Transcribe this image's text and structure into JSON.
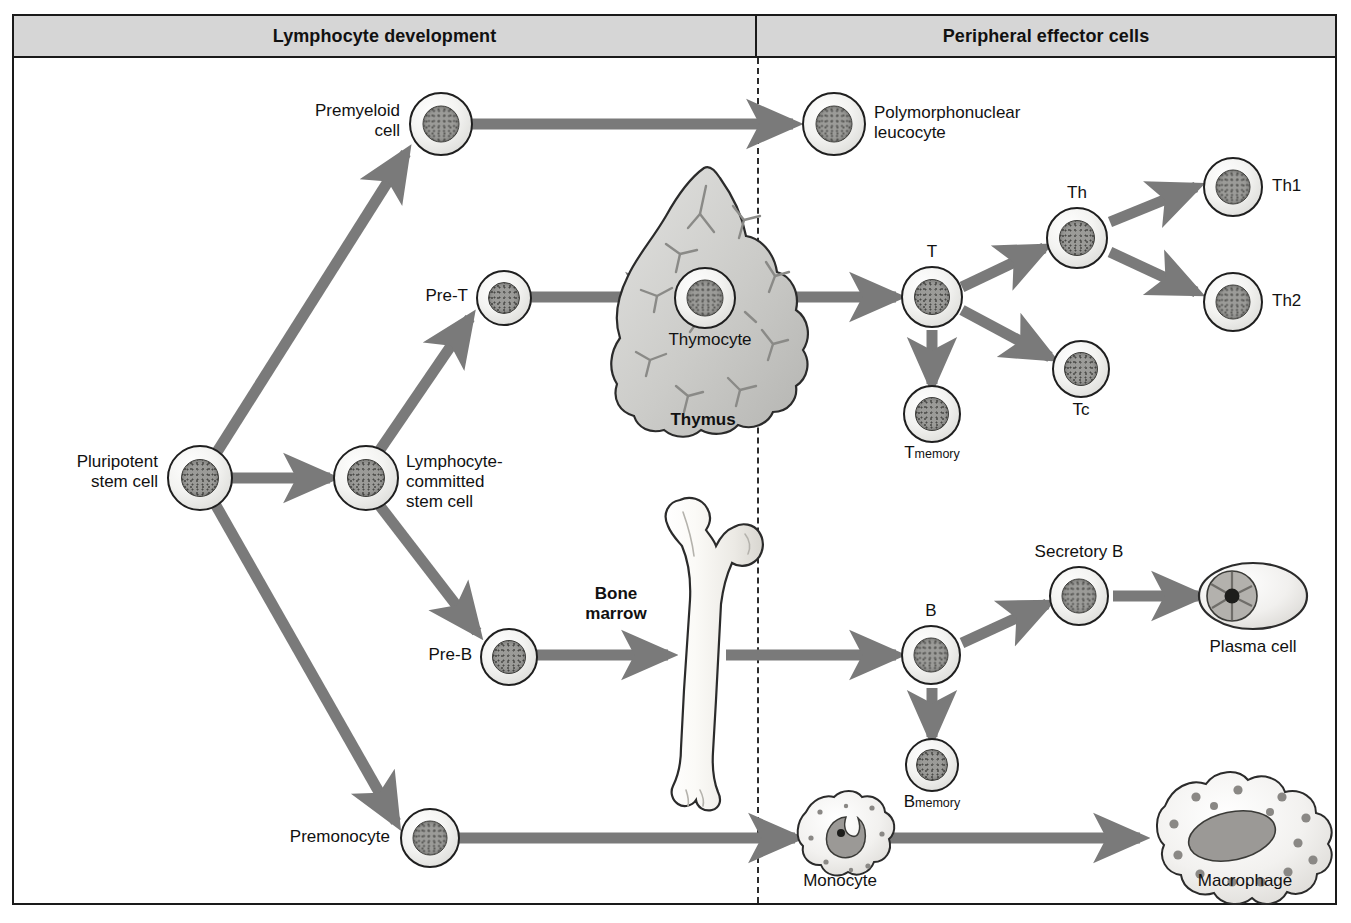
{
  "figure": {
    "type": "biology-flow-diagram"
  },
  "headers": {
    "left": "Lymphocyte development",
    "right": "Peripheral effector cells"
  },
  "colors": {
    "header_fill": "#d6d6d6",
    "frame_border": "#1a1a1a",
    "arrow": "#7a7a7a",
    "arrow_dark": "#6e6e6e",
    "cell_nucleus": "#9b9b98",
    "organ_fill": "#cdcdcb",
    "bone_fill": "#f2f1ee",
    "divider": "#2b2b2b"
  },
  "nodes": {
    "pluripotent": {
      "label": "Pluripotent\nstem cell"
    },
    "premyeloid": {
      "label": "Premyeloid\ncell"
    },
    "pmn": {
      "label": "Polymorphonuclear\nleucocyte"
    },
    "lymph_committed": {
      "label": "Lymphocyte-\ncommitted\nstem cell"
    },
    "pre_t": {
      "label": "Pre-T"
    },
    "thymocyte": {
      "label": "Thymocyte"
    },
    "thymus": {
      "label": "Thymus"
    },
    "t": {
      "label": "T"
    },
    "t_memory": {
      "label": "T",
      "sub": "memory"
    },
    "th": {
      "label": "Th"
    },
    "tc": {
      "label": "Tc"
    },
    "th1": {
      "label": "Th1"
    },
    "th2": {
      "label": "Th2"
    },
    "pre_b": {
      "label": "Pre-B"
    },
    "bone_marrow": {
      "label": "Bone\nmarrow"
    },
    "b": {
      "label": "B"
    },
    "b_memory": {
      "label": "B",
      "sub": "memory"
    },
    "secretory_b": {
      "label": "Secretory B"
    },
    "plasma_cell": {
      "label": "Plasma cell"
    },
    "premonocyte": {
      "label": "Premonocyte"
    },
    "monocyte": {
      "label": "Monocyte"
    },
    "macrophage": {
      "label": "Macrophage"
    }
  },
  "edges": [
    {
      "from": "pluripotent",
      "to": "premyeloid"
    },
    {
      "from": "pluripotent",
      "to": "lymph_committed"
    },
    {
      "from": "pluripotent",
      "to": "premonocyte"
    },
    {
      "from": "premyeloid",
      "to": "pmn"
    },
    {
      "from": "lymph_committed",
      "to": "pre_t"
    },
    {
      "from": "lymph_committed",
      "to": "pre_b"
    },
    {
      "from": "pre_t",
      "to": "thymocyte"
    },
    {
      "from": "thymocyte",
      "to": "t"
    },
    {
      "from": "t",
      "to": "t_memory"
    },
    {
      "from": "t",
      "to": "th"
    },
    {
      "from": "t",
      "to": "tc"
    },
    {
      "from": "th",
      "to": "th1"
    },
    {
      "from": "th",
      "to": "th2"
    },
    {
      "from": "pre_b",
      "to": "bone_marrow"
    },
    {
      "from": "bone_marrow",
      "to": "b"
    },
    {
      "from": "b",
      "to": "b_memory"
    },
    {
      "from": "b",
      "to": "secretory_b"
    },
    {
      "from": "secretory_b",
      "to": "plasma_cell"
    },
    {
      "from": "premonocyte",
      "to": "monocyte"
    },
    {
      "from": "monocyte",
      "to": "macrophage"
    }
  ]
}
